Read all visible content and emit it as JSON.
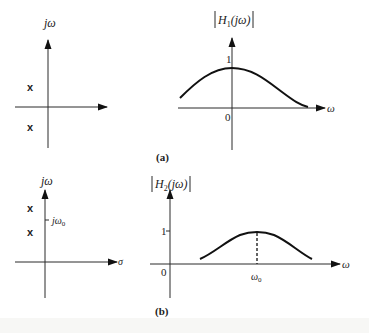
{
  "figure_a": {
    "caption": "(a)",
    "pole_zero_plot": {
      "vertical_axis_label": "jω",
      "pole_marker": "x",
      "poles": 2
    },
    "magnitude_plot": {
      "title_prefix": "H",
      "title_subscript": "1",
      "title_suffix": "(jω)",
      "x_axis_label": "ω",
      "tick_one": "1",
      "tick_zero": "0"
    }
  },
  "figure_b": {
    "caption": "(b)",
    "pole_zero_plot": {
      "vertical_axis_label": "jω",
      "horizontal_axis_label": "σ",
      "tick_label_prefix": "jω",
      "tick_label_subscript": "0",
      "pole_marker": "x",
      "poles": 2
    },
    "magnitude_plot": {
      "title_prefix": "H",
      "title_subscript": "2",
      "title_suffix": "(jω)",
      "x_axis_label": "ω",
      "tick_one": "1",
      "tick_zero": "0",
      "peak_label_prefix": "ω",
      "peak_label_subscript": "0"
    }
  },
  "colors": {
    "ink": "#111111",
    "background": "#ffffff"
  }
}
